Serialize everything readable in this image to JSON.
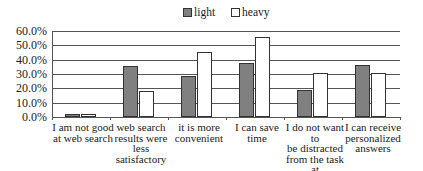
{
  "chart_data": {
    "type": "bar",
    "title": "",
    "xlabel": "",
    "ylabel": "",
    "ylim": [
      0,
      60
    ],
    "yticks": [
      "60.0%",
      "50.0%",
      "40.0%",
      "30.0%",
      "20.0%",
      "10.0%",
      "0.0%"
    ],
    "grid": true,
    "legend_position": "top",
    "categories": [
      "I am not good at web search",
      "web search results were less satisfactory",
      "it is more convenient",
      "I can save time",
      "I do not want to be distracted from the task at hand",
      "I can receive personalized answers"
    ],
    "series": [
      {
        "name": "light",
        "color": "#808080",
        "values": [
          2,
          35.5,
          28.5,
          37.5,
          19,
          36
        ]
      },
      {
        "name": "heavy",
        "color": "#ffffff",
        "values": [
          2,
          18,
          45.5,
          55.5,
          31,
          31
        ]
      }
    ]
  },
  "legend": {
    "light": "light",
    "heavy": "heavy"
  },
  "x_labels": [
    [
      "I am not good",
      "at web search"
    ],
    [
      "web search",
      "results were less",
      "satisfactory"
    ],
    [
      "it is more",
      "convenient"
    ],
    [
      "I can save",
      "time"
    ],
    [
      "I do not want to",
      "be distracted",
      "from the task at",
      "hand"
    ],
    [
      "I can receive",
      "personalized",
      "answers"
    ]
  ]
}
